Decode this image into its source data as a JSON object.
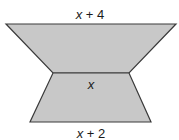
{
  "figure": {
    "shape_fill": "#c8c8c8",
    "stroke_color": "#3a3a3a",
    "labels": {
      "top": {
        "var": "x",
        "rest": " + 4"
      },
      "middle": {
        "var": "x",
        "rest": ""
      },
      "bottom": {
        "var": "x",
        "rest": " + 2"
      }
    }
  }
}
